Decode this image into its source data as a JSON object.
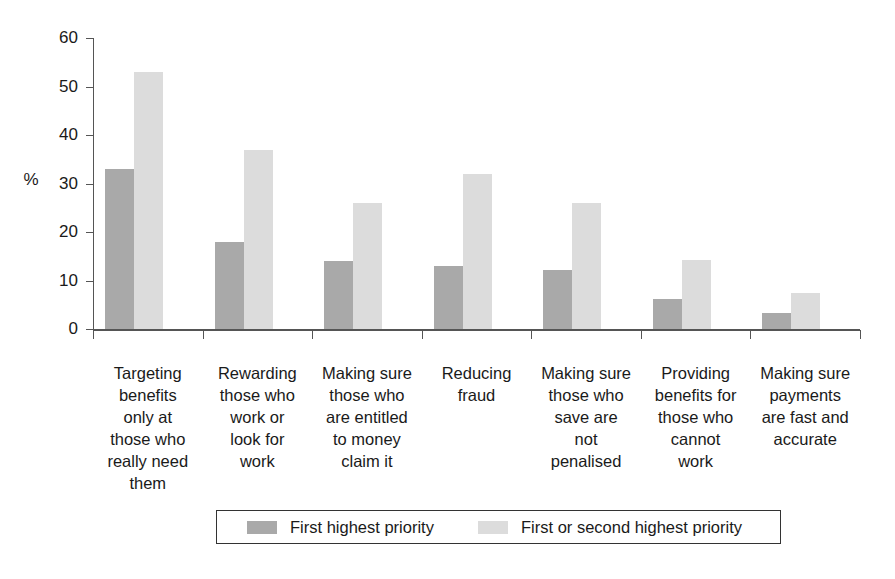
{
  "chart_data": {
    "type": "bar",
    "title": "",
    "subtitle": "",
    "xlabel": "",
    "ylabel": "%",
    "ylim": [
      0,
      60
    ],
    "ytick_values": [
      60,
      50,
      40,
      30,
      20,
      10,
      0
    ],
    "ytick_labels": [
      "60",
      "50",
      "40",
      "30",
      "20",
      "10",
      "0"
    ],
    "grid": false,
    "legend_position": "bottom",
    "categories": [
      "Targeting benefits only at those who really need them",
      "Rewarding those who work or look for work",
      "Making sure those who are entitled to money claim it",
      "Reducing fraud",
      "Making sure those who save are not penalised",
      "Providing benefits for those who cannot work",
      "Making sure payments are fast and accurate"
    ],
    "category_lines": [
      [
        "Targeting",
        "benefits",
        "only at",
        "those who",
        "really need",
        "them"
      ],
      [
        "Rewarding",
        "those who",
        "work or",
        "look for",
        "work"
      ],
      [
        "Making sure",
        "those who",
        "are entitled",
        "to money",
        "claim it"
      ],
      [
        "Reducing",
        "fraud"
      ],
      [
        "Making sure",
        "those who",
        "save are",
        "not",
        "penalised"
      ],
      [
        "Providing",
        "benefits for",
        "those who",
        "cannot",
        "work"
      ],
      [
        "Making sure",
        "payments",
        "are fast and",
        "accurate"
      ]
    ],
    "series": [
      {
        "name": "First highest priority",
        "color": "#a9a9a9",
        "values": [
          33,
          18,
          14,
          13,
          12.2,
          6.2,
          3.3
        ]
      },
      {
        "name": "First or second highest priority",
        "color": "#dcdcdc",
        "values": [
          53,
          37,
          26,
          32,
          26,
          14.3,
          7.5
        ]
      }
    ]
  },
  "legend": {
    "items": [
      {
        "label": "First highest priority",
        "color": "#a9a9a9"
      },
      {
        "label": "First or second highest priority",
        "color": "#dcdcdc"
      }
    ]
  }
}
